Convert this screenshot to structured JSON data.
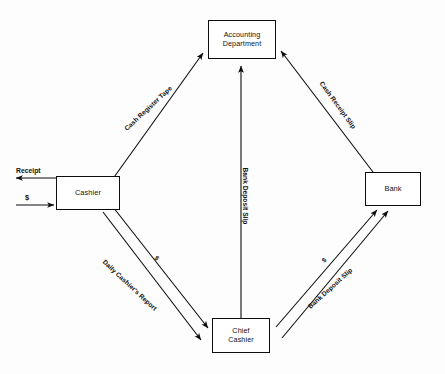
{
  "diagram": {
    "background_color": "#fdfdfd",
    "line_color": "#0d0d0d",
    "text_color": "#111111",
    "nodes": [
      {
        "id": "accounting",
        "label": "Accounting\nDepartment",
        "x": 208,
        "y": 20,
        "w": 68,
        "h": 39,
        "font_size": 7.2
      },
      {
        "id": "cashier",
        "label": "Cashier",
        "x": 56,
        "y": 176,
        "w": 64,
        "h": 34,
        "font_size": 7.4
      },
      {
        "id": "bank",
        "label": "Bank",
        "x": 365,
        "y": 172,
        "w": 56,
        "h": 34,
        "font_size": 7.4
      },
      {
        "id": "chief_cashier",
        "label": "Chief\nCashier",
        "x": 212,
        "y": 318,
        "w": 58,
        "h": 35,
        "font_size": 7.2
      }
    ],
    "edge_labels": [
      {
        "id": "cash-register-tape",
        "text": "Cash Register Tape",
        "x": 148,
        "y": 108,
        "rotate": -43,
        "font_size": 6.6
      },
      {
        "id": "cash-receipt-slip",
        "text": "Cash Receipt Slip",
        "x": 338,
        "y": 105,
        "rotate": 54,
        "font_size": 6.6
      },
      {
        "id": "bank-deposit-slip-center",
        "text": "Bank Deposit Slip",
        "x": 245,
        "y": 196,
        "rotate": 90,
        "font_size": 6.6
      },
      {
        "id": "daily-cashiers-report",
        "text": "Daily Cashier's Report",
        "x": 130,
        "y": 285,
        "rotate": 43,
        "font_size": 6.6
      },
      {
        "id": "bank-deposit-slip-right",
        "text": "Bank Deposit Slip",
        "x": 330,
        "y": 288,
        "rotate": -42,
        "font_size": 6.6
      }
    ],
    "money_labels": [
      {
        "id": "money-cashier-to-chief",
        "text": "$",
        "x": 157,
        "y": 258,
        "rotate": 43,
        "font_size": 6.5
      },
      {
        "id": "money-chief-to-bank",
        "text": "$",
        "x": 324,
        "y": 260,
        "rotate": -42,
        "font_size": 6.5
      }
    ],
    "io_labels": [
      {
        "id": "receipt-out",
        "text": "Receipt",
        "x": 16,
        "y": 167,
        "font_size": 6.8
      },
      {
        "id": "cash-in",
        "text": "$",
        "x": 25,
        "y": 193,
        "font_size": 7.4
      }
    ],
    "flows": [
      {
        "from": "cashier",
        "to": "accounting",
        "document": "Cash Register Tape"
      },
      {
        "from": "bank",
        "to": "accounting",
        "document": "Cash Receipt Slip"
      },
      {
        "from": "chief_cashier",
        "to": "accounting",
        "document": "Bank Deposit Slip"
      },
      {
        "from": "cashier",
        "to": "chief_cashier",
        "document": "Daily Cashier's Report",
        "value": "$"
      },
      {
        "from": "chief_cashier",
        "to": "bank",
        "document": "Bank Deposit Slip",
        "value": "$"
      },
      {
        "from": "cashier",
        "to": "customer",
        "document": "Receipt"
      },
      {
        "from": "customer",
        "to": "cashier",
        "document": "$"
      }
    ]
  }
}
